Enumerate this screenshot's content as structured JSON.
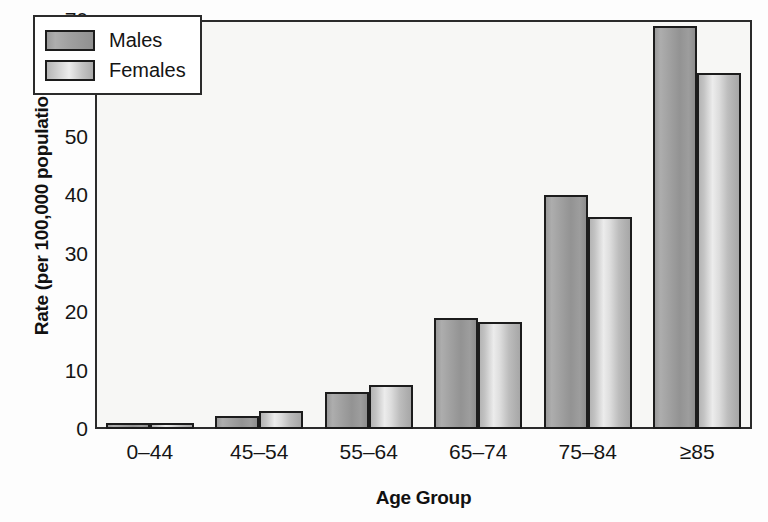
{
  "chart_data": {
    "type": "bar",
    "title": "",
    "xlabel": "Age Group",
    "ylabel": "Rate (per 100,000 population)",
    "categories": [
      "0–44",
      "45–54",
      "55–64",
      "65–74",
      "75–84",
      "≥85"
    ],
    "series": [
      {
        "name": "Males",
        "color": "#9e9e9e",
        "values": [
          1.0,
          2.2,
          6.4,
          19.0,
          40.0,
          69.0
        ]
      },
      {
        "name": "Females",
        "color": "#cccccc",
        "values": [
          1.0,
          3.0,
          7.6,
          18.4,
          36.3,
          61.0
        ]
      }
    ],
    "ylim": [
      0,
      70
    ],
    "yticks": [
      0,
      10,
      20,
      30,
      40,
      50,
      60,
      70
    ],
    "ytick_labels": [
      "0",
      "10",
      "20",
      "30",
      "40",
      "50",
      "60",
      "70"
    ],
    "grid": false,
    "legend_position": "top-left-inside",
    "axis_color": "#2b2b2b",
    "plot_background": "#f7f7f5"
  },
  "legend": {
    "entries": [
      {
        "label": "Males",
        "swatch": "males-swatch"
      },
      {
        "label": "Females",
        "swatch": "females-swatch"
      }
    ]
  },
  "axes": {
    "x_title": "Age Group",
    "y_title": "Rate (per 100,000 population)"
  }
}
